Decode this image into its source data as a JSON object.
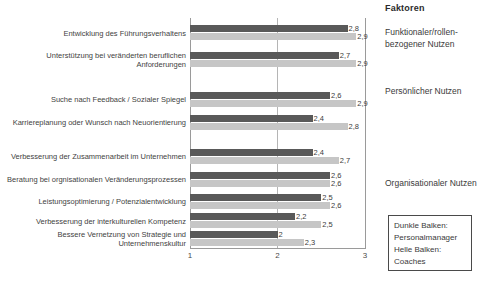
{
  "chart_data": {
    "type": "bar",
    "orientation": "horizontal",
    "title": "",
    "xlabel": "",
    "ylabel": "",
    "xlim": [
      1,
      3
    ],
    "xticks": [
      "1",
      "2",
      "3"
    ],
    "grid": true,
    "legend_position": "bottom-right",
    "categories": [
      "Entwicklung des Führungsverhaltens",
      "Unterstützung bei veränderten beruflichen Anforderungen",
      "Suche nach Feedback / Sozialer Spiegel",
      "Karriereplanung oder Wunsch nach Neuorientierung",
      "Verbesserung der Zusammenarbeit im Unternehmen",
      "Beratung bei orgnisationalen Veränderungsprozessen",
      "Leistungsoptimierung / Potenzialentwicklung",
      "Verbesserung der interkulturellen Kompetenz",
      "Bessere Vernetzung von Strategie und Unternehmenskultur"
    ],
    "series": [
      {
        "name": "Personalmanager",
        "color": "#595959",
        "values": [
          2.8,
          2.7,
          2.6,
          2.4,
          2.4,
          2.6,
          2.5,
          2.2,
          2.0
        ],
        "labels": [
          "2,8",
          "2,7",
          "2,6",
          "2,4",
          "2,4",
          "2,6",
          "2,5",
          "2,2",
          "2"
        ]
      },
      {
        "name": "Coaches",
        "color": "#c6c6c6",
        "values": [
          2.9,
          2.9,
          2.9,
          2.8,
          2.7,
          2.6,
          2.6,
          2.5,
          2.3
        ],
        "labels": [
          "2,9",
          "2,9",
          "2,9",
          "2,8",
          "2,7",
          "2,6",
          "2,6",
          "2,5",
          "2,3"
        ]
      }
    ]
  },
  "factors": {
    "heading": "Faktoren",
    "groups": [
      "Funktionaler/rollen-bezogener Nutzen",
      "Persönlicher Nutzen",
      "Organisationaler Nutzen"
    ]
  },
  "legend": {
    "lines": [
      "Dunkle Balken:",
      "Personalmanager",
      "Helle Balken:",
      "Coaches"
    ]
  }
}
